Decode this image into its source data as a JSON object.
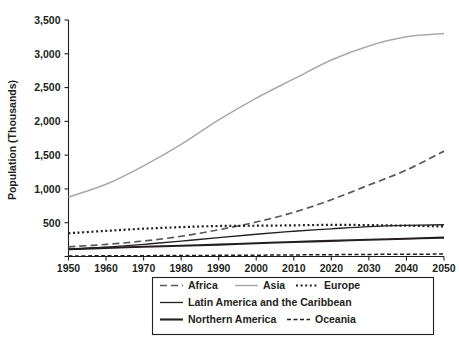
{
  "chart_data": {
    "type": "line",
    "title": "",
    "xlabel": "",
    "ylabel": "Population (Thousands)",
    "xlim": [
      1950,
      2050
    ],
    "ylim": [
      0,
      3500
    ],
    "grid": false,
    "legend_position": "bottom",
    "x": [
      1950,
      1960,
      1970,
      1980,
      1990,
      2000,
      2010,
      2020,
      2030,
      2040,
      2050
    ],
    "xticklabels": [
      "1950",
      "1960",
      "1970",
      "1980",
      "1990",
      "2000",
      "2010",
      "2020",
      "2030",
      "2040",
      "2050"
    ],
    "yticks": [
      0,
      500,
      1000,
      1500,
      2000,
      2500,
      3000,
      3500
    ],
    "yticklabels": [
      "",
      "500",
      "1,000",
      "1,500",
      "2,000",
      "2,500",
      "3,000",
      "3,500"
    ],
    "series": [
      {
        "name": "Africa",
        "color": "#58595b",
        "style": "dashed",
        "width": 1.7,
        "dash": "7,4",
        "values": [
          229,
          285,
          366,
          478,
          632,
          814,
          1044,
          1341,
          1688,
          2044,
          2489
        ]
      },
      {
        "name": "Asia",
        "color": "#a7a9ac",
        "style": "solid",
        "width": 1.5,
        "dash": "",
        "values": [
          1405,
          1706,
          2142,
          2650,
          3226,
          3741,
          4194,
          4641,
          4974,
          5189,
          5267
        ]
      },
      {
        "name": "Europe",
        "color": "#231f20",
        "style": "dotted",
        "width": 2.2,
        "dash": "2,2.6",
        "values": [
          549,
          605,
          657,
          694,
          721,
          727,
          736,
          748,
          741,
          728,
          710
        ]
      },
      {
        "name": "Latin America and the Caribbean",
        "color": "#231f20",
        "style": "solid",
        "width": 1.3,
        "dash": "",
        "values": [
          169,
          221,
          288,
          364,
          446,
          526,
          596,
          654,
          706,
          735,
          750
        ]
      },
      {
        "name": "Northern America",
        "color": "#231f20",
        "style": "solid",
        "width": 2.1,
        "dash": "",
        "values": [
          173,
          204,
          231,
          254,
          280,
          313,
          343,
          369,
          396,
          421,
          446
        ]
      },
      {
        "name": "Oceania",
        "color": "#231f20",
        "style": "dashed",
        "width": 1.5,
        "dash": "4,2.5",
        "values": [
          13,
          16,
          20,
          23,
          27,
          31,
          37,
          43,
          49,
          54,
          57
        ]
      }
    ]
  },
  "legend": {
    "entries": [
      {
        "label": "Africa"
      },
      {
        "label": "Asia"
      },
      {
        "label": "Europe"
      },
      {
        "label": "Latin America and the Caribbean"
      },
      {
        "label": "Northern America"
      },
      {
        "label": "Oceania"
      }
    ]
  }
}
